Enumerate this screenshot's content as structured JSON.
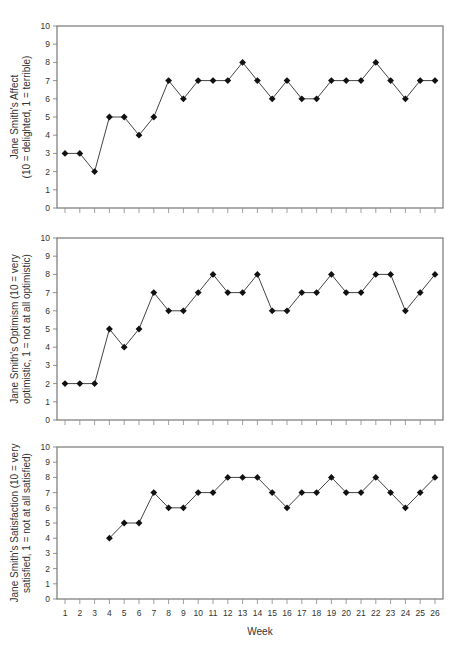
{
  "header": {
    "text": ""
  },
  "chart_data": [
    {
      "type": "line",
      "title": "",
      "xlabel": "",
      "ylabel": "Jane Smith's Affect (10 = delighted, 1 = terrible)",
      "ylabel_lines": [
        "Jane Smith's Affect",
        "(10 = delighted, 1 = terrible)"
      ],
      "ylim": [
        0,
        10
      ],
      "yticks": [
        0,
        1,
        2,
        3,
        4,
        5,
        6,
        7,
        8,
        9,
        10
      ],
      "x": [
        1,
        2,
        3,
        4,
        5,
        6,
        7,
        8,
        9,
        10,
        11,
        12,
        13,
        14,
        15,
        16,
        17,
        18,
        19,
        20,
        21,
        22,
        23,
        24,
        25,
        26
      ],
      "values": [
        3,
        3,
        2,
        5,
        5,
        4,
        5,
        7,
        6,
        7,
        7,
        7,
        8,
        7,
        6,
        7,
        6,
        6,
        7,
        7,
        7,
        8,
        7,
        6,
        7,
        7
      ],
      "marker": "diamond",
      "grid": false,
      "show_x_tick_labels": false
    },
    {
      "type": "line",
      "title": "",
      "xlabel": "",
      "ylabel": "Jane Smith's Optimism (10 = very optimistic, 1 = not at all optimistic)",
      "ylabel_lines": [
        "Jane Smith's Optimism (10 = very",
        "optimistic, 1 = not at all optimistic)"
      ],
      "ylim": [
        0,
        10
      ],
      "yticks": [
        0,
        1,
        2,
        3,
        4,
        5,
        6,
        7,
        8,
        9,
        10
      ],
      "x": [
        1,
        2,
        3,
        4,
        5,
        6,
        7,
        8,
        9,
        10,
        11,
        12,
        13,
        14,
        15,
        16,
        17,
        18,
        19,
        20,
        21,
        22,
        23,
        24,
        25,
        26
      ],
      "values": [
        2,
        2,
        2,
        5,
        4,
        5,
        7,
        6,
        6,
        7,
        8,
        7,
        7,
        8,
        6,
        6,
        7,
        7,
        8,
        7,
        7,
        8,
        8,
        6,
        7,
        8
      ],
      "marker": "diamond",
      "grid": false,
      "show_x_tick_labels": false
    },
    {
      "type": "line",
      "title": "",
      "xlabel": "Week",
      "ylabel": "Jane Smith's Satisfaction (10 = very satisfied, 1 = not at all satisfied)",
      "ylabel_lines": [
        "Jane Smith's Satisfaction (10 = very",
        "satisfied, 1 = not at all satisfied)"
      ],
      "ylim": [
        0,
        10
      ],
      "yticks": [
        0,
        1,
        2,
        3,
        4,
        5,
        6,
        7,
        8,
        9,
        10
      ],
      "x": [
        1,
        2,
        3,
        4,
        5,
        6,
        7,
        8,
        9,
        10,
        11,
        12,
        13,
        14,
        15,
        16,
        17,
        18,
        19,
        20,
        21,
        22,
        23,
        24,
        25,
        26
      ],
      "values": [
        null,
        null,
        null,
        4,
        5,
        5,
        7,
        6,
        6,
        7,
        7,
        8,
        8,
        8,
        7,
        6,
        7,
        7,
        8,
        7,
        7,
        8,
        7,
        6,
        7,
        8
      ],
      "marker": "diamond",
      "grid": false,
      "show_x_tick_labels": true
    }
  ]
}
